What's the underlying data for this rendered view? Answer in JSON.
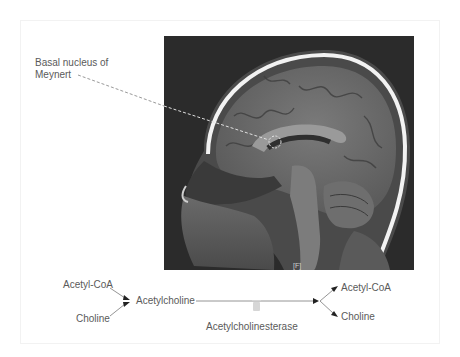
{
  "figure": {
    "annotation": {
      "line1": "Basal nucleus of",
      "line2": "Meynert",
      "target": {
        "x": 275,
        "y": 142,
        "radius": 6
      }
    },
    "mri": {
      "description": "Sagittal T1 MRI of the head",
      "tag": "[F]"
    },
    "reaction": {
      "reactants": [
        "Acetyl-CoA",
        "Choline"
      ],
      "product": "Acetylcholine",
      "enzyme": "Acetylcholinesterase",
      "enzyme_icon": "enzyme-block-icon",
      "breakdown_products": [
        "Acetyl-CoA",
        "Choline"
      ]
    },
    "colors": {
      "text": "#5a5a5a",
      "line": "#7a7a7a",
      "mri_background": "#2b2b2b",
      "dashed_pointer": "#d8d8d8"
    }
  }
}
